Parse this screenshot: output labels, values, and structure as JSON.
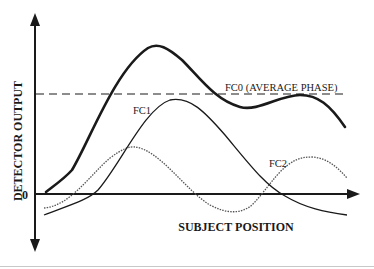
{
  "diagram": {
    "y_axis_label": "DETECTOR OUTPUT",
    "x_axis_label": "SUBJECT POSITION",
    "zero_label": "0",
    "curves": {
      "sum": {
        "name": "combined output",
        "style": "bold solid"
      },
      "fc0": {
        "label": "FC0 (AVERAGE PHASE)",
        "style": "dashed"
      },
      "fc1": {
        "label": "FC1",
        "style": "thin solid"
      },
      "fc2": {
        "label": "FC2",
        "style": "dotted"
      }
    },
    "colors": {
      "ink": "#1a1a1a",
      "fc2": "#555555"
    }
  }
}
